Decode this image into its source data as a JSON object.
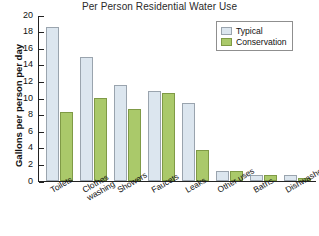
{
  "chart_data": {
    "type": "bar",
    "title": "Per Person Residential Water Use",
    "xlabel": "",
    "ylabel": "Gallons per person per day",
    "ylim": [
      0,
      20
    ],
    "ytick_step": 2,
    "yticks": [
      20,
      18,
      16,
      14,
      12,
      10,
      8,
      6,
      4,
      2,
      0
    ],
    "grid": false,
    "legend_position": "top-right",
    "categories": [
      "Toilets",
      "Clothes\nwashing",
      "Showers",
      "Faucets",
      "Leaks",
      "Other uses",
      "Baths",
      "Dishwashers"
    ],
    "series": [
      {
        "name": "Typical",
        "color": "#dce6ef",
        "values": [
          18.6,
          15.0,
          11.6,
          10.8,
          9.4,
          1.2,
          0.7,
          0.7
        ]
      },
      {
        "name": "Conservation",
        "color": "#aac96a",
        "values": [
          8.3,
          10.0,
          8.7,
          10.6,
          3.7,
          1.2,
          0.7,
          0.4
        ]
      }
    ]
  },
  "legend": {
    "entries": [
      {
        "label": "Typical",
        "swatch": "typical"
      },
      {
        "label": "Conservation",
        "swatch": "conservation"
      }
    ]
  }
}
